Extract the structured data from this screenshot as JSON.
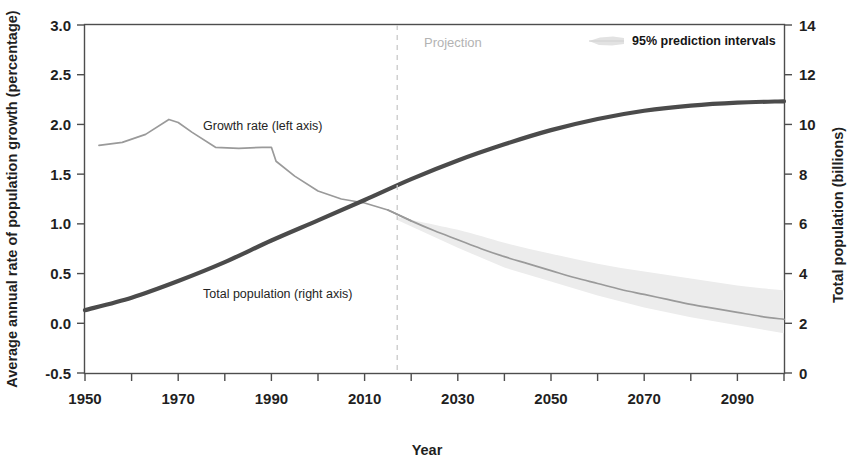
{
  "chart_data": {
    "type": "line",
    "title": "",
    "xlabel": "Year",
    "ylabel_left": "Average annual rate of population growth (percentage)",
    "ylabel_right": "Total population (billions)",
    "xlim": [
      1950,
      2100
    ],
    "xticks_major": [
      1950,
      1970,
      1990,
      2010,
      2030,
      2050,
      2070,
      2090
    ],
    "xticks_minor": [
      1960,
      1980,
      2000,
      2020,
      2040,
      2060,
      2080,
      2100
    ],
    "ylim_left": [
      -0.5,
      3.0
    ],
    "yticks_left": [
      "3.0",
      "2.5",
      "2.0",
      "1.5",
      "1.0",
      "0.5",
      "0.0",
      "-0.5"
    ],
    "ylim_right": [
      0,
      14
    ],
    "yticks_right": [
      "14",
      "12",
      "10",
      "8",
      "6",
      "4",
      "2",
      "0"
    ],
    "grid": false,
    "legend_position": "top-right",
    "annotations": {
      "projection_divider_year": 2017,
      "projection_label": "Projection",
      "growth_label": "Growth rate (left axis)",
      "population_label": "Total population (right axis)",
      "legend_label": "95% prediction intervals"
    },
    "colors": {
      "growth_rate_line": "#9a9a9a",
      "population_line": "#4b4b4b",
      "prediction_band": "#ececec",
      "projection_divider": "#c9c9c9",
      "axis": "#4d4d4d",
      "background": "#ffffff"
    },
    "series": [
      {
        "name": "Growth rate (left axis)",
        "axis": "left",
        "unit": "percentage",
        "x": [
          1953,
          1958,
          1963,
          1968,
          1970,
          1973,
          1978,
          1983,
          1988,
          1990,
          1991,
          1995,
          2000,
          2005,
          2010,
          2015,
          2020,
          2025,
          2030,
          2035,
          2040,
          2045,
          2050,
          2055,
          2060,
          2065,
          2070,
          2075,
          2080,
          2085,
          2090,
          2095,
          2100
        ],
        "y": [
          1.79,
          1.82,
          1.9,
          2.05,
          2.02,
          1.92,
          1.77,
          1.76,
          1.77,
          1.77,
          1.63,
          1.48,
          1.33,
          1.25,
          1.21,
          1.14,
          1.03,
          0.93,
          0.84,
          0.75,
          0.67,
          0.6,
          0.53,
          0.46,
          0.4,
          0.34,
          0.29,
          0.24,
          0.19,
          0.15,
          0.11,
          0.07,
          0.04
        ]
      },
      {
        "name": "Total population (right axis)",
        "axis": "right",
        "unit": "billions",
        "x": [
          1950,
          1960,
          1970,
          1980,
          1990,
          2000,
          2010,
          2020,
          2030,
          2040,
          2050,
          2060,
          2070,
          2080,
          2090,
          2100
        ],
        "y": [
          2.53,
          3.03,
          3.7,
          4.46,
          5.33,
          6.14,
          6.96,
          7.8,
          8.55,
          9.2,
          9.77,
          10.22,
          10.55,
          10.76,
          10.88,
          10.93
        ]
      },
      {
        "name": "95% prediction intervals",
        "axis": "left",
        "type": "band",
        "x": [
          2017,
          2030,
          2040,
          2050,
          2060,
          2070,
          2080,
          2090,
          2100
        ],
        "y_lower": [
          1.04,
          0.76,
          0.56,
          0.42,
          0.28,
          0.16,
          0.06,
          -0.02,
          -0.1
        ],
        "y_upper": [
          1.07,
          0.94,
          0.81,
          0.7,
          0.6,
          0.52,
          0.45,
          0.38,
          0.33
        ]
      }
    ]
  },
  "chart": {
    "xlabel": "Year",
    "ylabel_left": "Average annual rate of population growth (percentage)",
    "ylabel_right": "Total population (billions)",
    "projection_label": "Projection",
    "legend_label": "95% prediction intervals",
    "growth_label": "Growth rate (left axis)",
    "population_label": "Total population (right axis)",
    "yticks_left": [
      "3.0",
      "2.5",
      "2.0",
      "1.5",
      "1.0",
      "0.5",
      "0.0",
      "-0.5"
    ],
    "yticks_right": [
      "14",
      "12",
      "10",
      "8",
      "6",
      "4",
      "2",
      "0"
    ],
    "xticks": [
      "1950",
      "1970",
      "1990",
      "2010",
      "2030",
      "2050",
      "2070",
      "2090"
    ]
  }
}
